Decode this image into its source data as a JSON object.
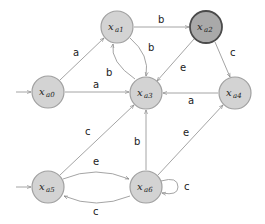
{
  "diagram": {
    "type": "state-machine",
    "colors": {
      "node_fill": "#d3d3d3",
      "node_stroke": "#a0a0a0",
      "accepting_fill": "#a9a9a9",
      "accepting_stroke": "#4a4a4a",
      "edge": "#9a9a9a"
    },
    "nodes": [
      {
        "id": "xa0",
        "base": "x",
        "sub": "a0",
        "initial": true,
        "highlighted": false
      },
      {
        "id": "xa1",
        "base": "x",
        "sub": "a1",
        "initial": false,
        "highlighted": false
      },
      {
        "id": "xa2",
        "base": "x",
        "sub": "a2",
        "initial": false,
        "highlighted": true
      },
      {
        "id": "xa3",
        "base": "x",
        "sub": "a3",
        "initial": false,
        "highlighted": false
      },
      {
        "id": "xa4",
        "base": "x",
        "sub": "a4",
        "initial": false,
        "highlighted": false
      },
      {
        "id": "xa5",
        "base": "x",
        "sub": "a5",
        "initial": true,
        "highlighted": false
      },
      {
        "id": "xa6",
        "base": "x",
        "sub": "a6",
        "initial": false,
        "highlighted": false
      }
    ],
    "edges": [
      {
        "from": "xa0",
        "to": "xa1",
        "label": "a"
      },
      {
        "from": "xa0",
        "to": "xa3",
        "label": "a"
      },
      {
        "from": "xa1",
        "to": "xa2",
        "label": "b"
      },
      {
        "from": "xa1",
        "to": "xa3",
        "label": "b"
      },
      {
        "from": "xa3",
        "to": "xa1",
        "label": "b"
      },
      {
        "from": "xa2",
        "to": "xa3",
        "label": "e"
      },
      {
        "from": "xa2",
        "to": "xa4",
        "label": "c"
      },
      {
        "from": "xa4",
        "to": "xa3",
        "label": "a"
      },
      {
        "from": "xa5",
        "to": "xa3",
        "label": "c"
      },
      {
        "from": "xa5",
        "to": "xa6",
        "label": "e"
      },
      {
        "from": "xa6",
        "to": "xa5",
        "label": "c"
      },
      {
        "from": "xa6",
        "to": "xa3",
        "label": "b"
      },
      {
        "from": "xa6",
        "to": "xa4",
        "label": "e"
      },
      {
        "from": "xa6",
        "to": "xa6",
        "label": "c"
      }
    ]
  }
}
